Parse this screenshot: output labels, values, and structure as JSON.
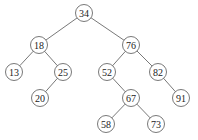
{
  "diagram": {
    "type": "binary-search-tree",
    "node_radius": 8.5,
    "stroke_color": "#555555",
    "text_color": "#222222",
    "nodes": [
      {
        "id": "n34",
        "label": "34",
        "x": 84,
        "y": 13
      },
      {
        "id": "n18",
        "label": "18",
        "x": 39,
        "y": 45
      },
      {
        "id": "n76",
        "label": "76",
        "x": 131,
        "y": 45
      },
      {
        "id": "n13",
        "label": "13",
        "x": 14,
        "y": 72
      },
      {
        "id": "n25",
        "label": "25",
        "x": 63,
        "y": 72
      },
      {
        "id": "n52",
        "label": "52",
        "x": 107,
        "y": 72
      },
      {
        "id": "n82",
        "label": "82",
        "x": 158,
        "y": 72
      },
      {
        "id": "n20",
        "label": "20",
        "x": 40,
        "y": 98
      },
      {
        "id": "n67",
        "label": "67",
        "x": 131,
        "y": 98
      },
      {
        "id": "n91",
        "label": "91",
        "x": 181,
        "y": 98
      },
      {
        "id": "n58",
        "label": "58",
        "x": 106,
        "y": 124
      },
      {
        "id": "n73",
        "label": "73",
        "x": 156,
        "y": 124
      }
    ],
    "edges": [
      {
        "from": "n34",
        "to": "n18"
      },
      {
        "from": "n34",
        "to": "n76"
      },
      {
        "from": "n18",
        "to": "n13"
      },
      {
        "from": "n18",
        "to": "n25"
      },
      {
        "from": "n25",
        "to": "n20"
      },
      {
        "from": "n76",
        "to": "n52"
      },
      {
        "from": "n76",
        "to": "n82"
      },
      {
        "from": "n52",
        "to": "n67"
      },
      {
        "from": "n82",
        "to": "n91"
      },
      {
        "from": "n67",
        "to": "n58"
      },
      {
        "from": "n67",
        "to": "n73"
      }
    ]
  }
}
